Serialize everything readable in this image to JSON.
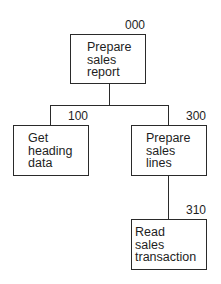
{
  "diagram": {
    "type": "structure-chart",
    "nodes": [
      {
        "id": "000",
        "number": "000",
        "lines": [
          "Prepare",
          "sales",
          "report"
        ]
      },
      {
        "id": "100",
        "number": "100",
        "lines": [
          "Get",
          "heading",
          "data"
        ]
      },
      {
        "id": "300",
        "number": "300",
        "lines": [
          "Prepare",
          "sales",
          "lines"
        ]
      },
      {
        "id": "310",
        "number": "310",
        "lines": [
          "Read",
          "sales",
          "transaction"
        ]
      }
    ],
    "edges": [
      {
        "from": "000",
        "to": "100"
      },
      {
        "from": "000",
        "to": "300"
      },
      {
        "from": "300",
        "to": "310"
      }
    ]
  }
}
